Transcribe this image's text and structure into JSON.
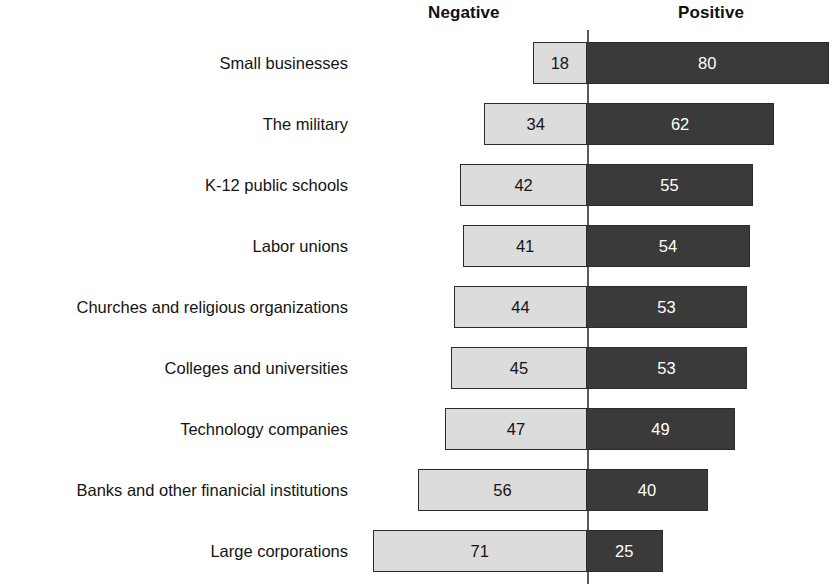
{
  "headers": {
    "negative": "Negative",
    "positive": "Positive"
  },
  "colors": {
    "negative_fill": "#dcdcdc",
    "positive_fill": "#3a3a3a",
    "bar_border": "#2b2b2b",
    "axis_line": "#5a5a5a",
    "background": "#ffffff",
    "negative_label_text": "#141414",
    "positive_label_text": "#ffffff"
  },
  "chart_data": {
    "type": "bar",
    "subtype": "diverging-stacked-bar",
    "title": "",
    "xlabel": "",
    "ylabel": "",
    "grid": false,
    "legend_position": "top",
    "orientation": "horizontal",
    "axis_origin_label": "0",
    "categories": [
      "Small businesses",
      "The military",
      "K-12 public schools",
      "Labor unions",
      "Churches and religious organizations",
      "Colleges and universities",
      "Technology companies",
      "Banks and other finanicial institutions",
      "Large corporations"
    ],
    "series": [
      {
        "name": "Negative",
        "direction": "left",
        "values": [
          18,
          34,
          42,
          41,
          44,
          45,
          47,
          56,
          71
        ]
      },
      {
        "name": "Positive",
        "direction": "right",
        "values": [
          80,
          62,
          55,
          54,
          53,
          53,
          49,
          40,
          25
        ]
      }
    ],
    "value_labels": {
      "negative": [
        "18",
        "34",
        "42",
        "41",
        "44",
        "45",
        "47",
        "56",
        "71"
      ],
      "positive": [
        "80",
        "62",
        "55",
        "54",
        "53",
        "53",
        "49",
        "40",
        "25"
      ]
    },
    "xlim": [
      -71,
      80
    ]
  },
  "layout": {
    "zero_x_px": 587,
    "px_per_unit": 3.02,
    "first_row_top_px": 42,
    "row_pitch_px": 61,
    "bar_height_px": 42
  }
}
